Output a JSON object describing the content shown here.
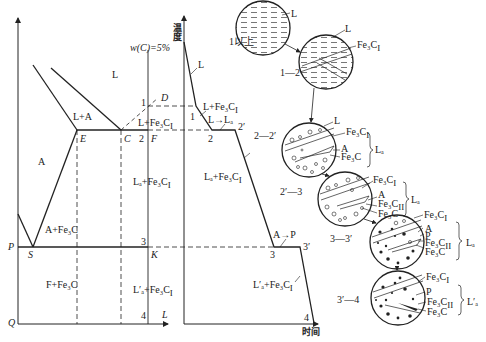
{
  "phase_diagram": {
    "composition_label": "w(C)=5%",
    "regions": {
      "L": "L",
      "L_A": "L+A",
      "A": "A",
      "A_Fe3C": "A+Fe₃C",
      "F_Fe3C": "F+Fe₃C",
      "L_Fe3CI": "L+Fe₃C",
      "Ld_Fe3CI": "Lₐ+Fe₃C",
      "Ld2_Fe3CI": "L′ₐ+Fe₃C"
    },
    "sub_I": "I",
    "points": {
      "D": "D",
      "C": "C",
      "E": "E",
      "F": "F",
      "K": "K",
      "P": "P",
      "S": "S",
      "Q": "Q",
      "L": "L"
    },
    "markers": [
      "1",
      "2",
      "3",
      "4"
    ]
  },
  "cooling_curve": {
    "y_axis_label": "温度",
    "x_axis_label": "时间",
    "labels": {
      "L": "L",
      "L_Fe3CI": "L+Fe₃C",
      "L_to_Ld": "L→Lₐ",
      "Ld_Fe3CI": "Lₐ+Fe₃C",
      "A_to_P": "A→P",
      "Ld2_Fe3CI": "L′ₐ+Fe₃C"
    },
    "points": [
      "1",
      "2",
      "2′",
      "3",
      "3′",
      "4"
    ]
  },
  "microstructures": [
    {
      "stage": "1以上",
      "labels": [
        "L"
      ]
    },
    {
      "stage": "1—2",
      "labels": [
        "L",
        "Fe₃C"
      ]
    },
    {
      "stage": "2—2′",
      "labels": [
        "L",
        "Fe₃C",
        "A",
        "Fe₃C"
      ],
      "bracket": "Lₐ"
    },
    {
      "stage": "2′—3",
      "labels": [
        "Fe₃C",
        "A",
        "Fe₃C",
        "Fe₃C"
      ],
      "bracket": "Lₐ"
    },
    {
      "stage": "3—3′",
      "labels": [
        "Fe₃C",
        "A",
        "P",
        "Fe₃C",
        "Fe₃C"
      ],
      "bracket": "Lₐ"
    },
    {
      "stage": "3′—4",
      "labels": [
        "Fe₃C",
        "P",
        "Fe₃C",
        "Fe₃C"
      ],
      "bracket": "L′ₐ"
    }
  ]
}
